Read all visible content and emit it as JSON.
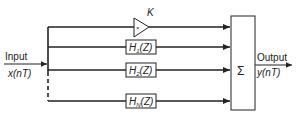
{
  "diagram": {
    "input": {
      "label": "Input",
      "signal": "x(nT)"
    },
    "output": {
      "label": "Output",
      "signal": "y(nT)"
    },
    "gain": {
      "symbol": "K",
      "inner": "×"
    },
    "filters": [
      {
        "label": "H1(Z)",
        "name": "H",
        "sub": "1"
      },
      {
        "label": "H2(Z)",
        "name": "H",
        "sub": "2"
      },
      {
        "label": "HN(Z)",
        "name": "H",
        "sub": "N"
      }
    ],
    "summer": {
      "symbol": "Σ"
    },
    "colors": {
      "line": "#222222",
      "background": "#ffffff"
    }
  }
}
